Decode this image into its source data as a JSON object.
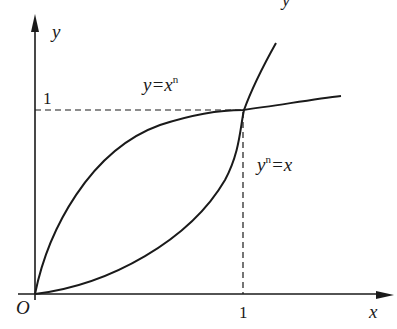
{
  "figure": {
    "colors": {
      "stroke": "#1a1a1a",
      "background": "#ffffff"
    },
    "axes": {
      "x_label": "x",
      "y_label": "y",
      "origin_label": "O",
      "x_tick_label": "1",
      "y_tick_label": "1"
    },
    "curves": [
      {
        "id": "power",
        "label_base": "y=x",
        "label_sup": "n",
        "shape": "concave, through (0,0) and (1,1)"
      },
      {
        "id": "inverse",
        "label_base_y": "y",
        "label_sup": "n",
        "label_rest": "=x",
        "shape": "convex, through (0,0) and (1,1)"
      }
    ],
    "intersection": {
      "x": 1,
      "y": 1
    },
    "top_fragment": "y"
  }
}
